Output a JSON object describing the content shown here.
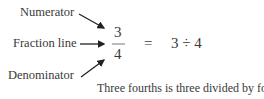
{
  "labels": {
    "numerator": "Numerator",
    "fraction_line": "Fraction line",
    "denominator": "Denominator"
  },
  "fraction": {
    "numerator": "3",
    "denominator": "4"
  },
  "equals": "=",
  "expression": "3 ÷ 4",
  "caption": "Three fourths is three divided by four."
}
